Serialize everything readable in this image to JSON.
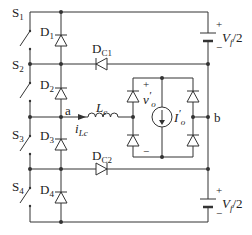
{
  "diagram": {
    "type": "power-electronics-circuit",
    "colors": {
      "wire": "#333333",
      "background": "#ffffff"
    },
    "switches": [
      {
        "id": "S1",
        "label": "S",
        "sub": "1"
      },
      {
        "id": "S2",
        "label": "S",
        "sub": "2"
      },
      {
        "id": "S3",
        "label": "S",
        "sub": "3"
      },
      {
        "id": "S4",
        "label": "S",
        "sub": "4"
      }
    ],
    "diodes": [
      {
        "id": "D1",
        "label": "D",
        "sub": "1"
      },
      {
        "id": "D2",
        "label": "D",
        "sub": "2"
      },
      {
        "id": "D3",
        "label": "D",
        "sub": "3"
      },
      {
        "id": "D4",
        "label": "D",
        "sub": "4"
      },
      {
        "id": "DC1",
        "label": "D",
        "sub": "C1"
      },
      {
        "id": "DC2",
        "label": "D",
        "sub": "C2"
      }
    ],
    "inductor": {
      "label": "L",
      "sub": "c"
    },
    "inductor_current": {
      "label": "i",
      "sub": "Lc"
    },
    "nodes": {
      "a": "a",
      "b": "b"
    },
    "sources": {
      "top": {
        "label": "V",
        "sub": "f",
        "suffix": "/2",
        "plus": "+",
        "minus": "−"
      },
      "bottom": {
        "label": "V",
        "sub": "f",
        "suffix": "/2",
        "plus": "+",
        "minus": "−"
      }
    },
    "load": {
      "voltage": {
        "label": "v",
        "sub": "o",
        "prime": "′",
        "plus": "+",
        "minus": "−"
      },
      "current_source": {
        "label": "I",
        "sub": "o",
        "prime": "′"
      }
    }
  }
}
